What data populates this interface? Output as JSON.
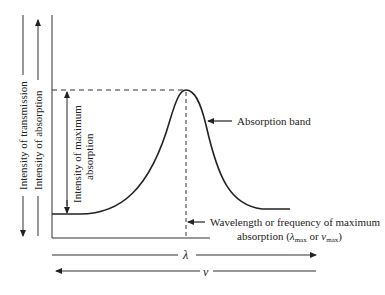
{
  "diagram": {
    "type": "absorption-spectrum-schematic",
    "labels": {
      "y_transmission": "Intensity of transmission",
      "y_absorption": "Intensity of absorption",
      "max_absorption_line1": "Intensity of maximum",
      "max_absorption_line2": "absorption",
      "absorption_band": "Absorption band",
      "wavelength_line1": "Wavelength or frequency of maximum",
      "wavelength_line2_prefix": "absorption (",
      "lambda": "λ",
      "lambda_sub": "max",
      "or": " or ",
      "nu": "ν",
      "nu_sub": "max",
      "wavelength_line2_suffix": ")",
      "x_lambda": "λ",
      "x_nu": "ν"
    },
    "colors": {
      "ink": "#222222",
      "background": "#ffffff"
    }
  }
}
